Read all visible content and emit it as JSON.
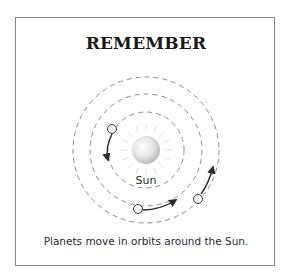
{
  "card": {
    "title": "REMEMBER",
    "caption": "Planets move in orbits around the Sun."
  },
  "diagram": {
    "sun_label": "Sun",
    "center": [
      146,
      150
    ],
    "orbits": [
      {
        "name": "inner",
        "radius": 38
      },
      {
        "name": "middle",
        "radius": 56
      },
      {
        "name": "outer",
        "radius": 73
      }
    ],
    "planets": [
      {
        "name": "planet-inner",
        "pos": [
          112,
          129
        ]
      },
      {
        "name": "planet-middle",
        "pos": [
          138,
          209
        ]
      },
      {
        "name": "planet-outer",
        "pos": [
          198,
          199
        ]
      }
    ],
    "colors": {
      "border": "#8a8a8a",
      "orbit": "#8c8c8c",
      "arrow": "#2b2b2b",
      "sun_light": "#ffffff",
      "sun_dark": "#c4c4c4",
      "sun_rays": "#e2e2e2"
    }
  }
}
